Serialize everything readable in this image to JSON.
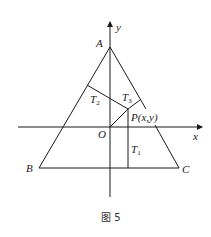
{
  "figure": {
    "caption": "图 5",
    "axes": {
      "x_label": "x",
      "y_label": "y",
      "origin_label": "O"
    },
    "vertices": {
      "A": "A",
      "B": "B",
      "C": "C"
    },
    "point": {
      "label": "P(x,y)"
    },
    "distances": {
      "T1": "T",
      "T1_sub": "1",
      "T2": "T",
      "T2_sub": "2",
      "T3": "T",
      "T3_sub": "3"
    },
    "colors": {
      "stroke": "#1a1a1a",
      "background": "#ffffff"
    }
  }
}
